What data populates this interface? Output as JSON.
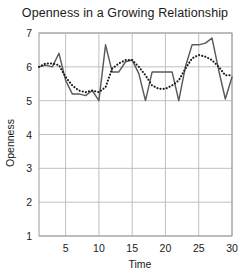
{
  "chart_data": {
    "type": "line",
    "title": "Openness in a Growing Relationship",
    "xlabel": "Time",
    "ylabel": "Openness",
    "xlim": [
      1,
      30
    ],
    "ylim": [
      1,
      7
    ],
    "xticks": [
      5,
      10,
      15,
      20,
      25,
      30
    ],
    "yticks": [
      1,
      2,
      3,
      4,
      5,
      6,
      7
    ],
    "grid": true,
    "legend": "none",
    "x": [
      1,
      2,
      3,
      4,
      5,
      6,
      7,
      8,
      9,
      10,
      11,
      12,
      13,
      14,
      15,
      16,
      17,
      18,
      19,
      20,
      21,
      22,
      23,
      24,
      25,
      26,
      27,
      28,
      29,
      30
    ],
    "series": [
      {
        "name": "observed",
        "style": "solid",
        "color": "#5a5a5a",
        "values": [
          6.0,
          6.05,
          6.0,
          6.4,
          5.6,
          5.2,
          5.2,
          5.15,
          5.3,
          5.0,
          6.65,
          5.85,
          5.85,
          6.15,
          6.2,
          5.8,
          5.0,
          5.85,
          5.85,
          5.85,
          5.85,
          5.0,
          6.0,
          6.65,
          6.65,
          6.7,
          6.85,
          5.9,
          5.05,
          5.7
        ]
      },
      {
        "name": "trend",
        "style": "dotted",
        "color": "#1a1a1a",
        "values": [
          6.0,
          6.1,
          6.1,
          6.05,
          5.7,
          5.45,
          5.3,
          5.25,
          5.3,
          5.25,
          5.4,
          5.95,
          6.1,
          6.2,
          6.2,
          6.0,
          5.75,
          5.45,
          5.35,
          5.35,
          5.45,
          5.6,
          5.95,
          6.25,
          6.35,
          6.3,
          6.2,
          6.0,
          5.75,
          5.75
        ]
      }
    ]
  },
  "axis": {
    "y_title": "Openness",
    "x_title": "Time",
    "y_tick_labels": [
      "7",
      "6",
      "5",
      "4",
      "3",
      "2",
      "1"
    ],
    "x_tick_labels": [
      "5",
      "10",
      "15",
      "20",
      "25",
      "30"
    ]
  },
  "colors": {
    "grid": "#b9b9b9",
    "frame": "#9a9a9a",
    "text": "#1a1a1a",
    "series_solid": "#5a5a5a",
    "series_dotted": "#1a1a1a",
    "background": "#ffffff"
  }
}
